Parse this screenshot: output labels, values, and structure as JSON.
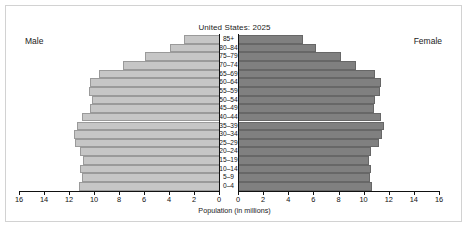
{
  "chart_data": {
    "type": "bar",
    "subtype": "population-pyramid",
    "title": "United States: 2025",
    "xlabel": "Population (in millions)",
    "ylabel": "",
    "grid": false,
    "legend_position": "inline-sides",
    "left_side_label": "Male",
    "right_side_label": "Female",
    "xlim_left": [
      16,
      0
    ],
    "xlim_right": [
      0,
      16
    ],
    "xticks_left": [
      "16",
      "14",
      "12",
      "10",
      "8",
      "6",
      "4",
      "2",
      "0"
    ],
    "xticks_right": [
      "0",
      "2",
      "4",
      "6",
      "8",
      "10",
      "12",
      "14",
      "16"
    ],
    "xtick_values": [
      16,
      14,
      12,
      10,
      8,
      6,
      4,
      2,
      0
    ],
    "categories": [
      "85+",
      "80–84",
      "75–79",
      "70–74",
      "65–69",
      "60–64",
      "55–59",
      "50–54",
      "45–49",
      "40–44",
      "35–39",
      "30–34",
      "25–29",
      "20–24",
      "15–19",
      "10–14",
      "5–9",
      "0–4"
    ],
    "series": [
      {
        "name": "Male",
        "side": "left",
        "color": "#c6c6c6",
        "values": [
          2.8,
          3.9,
          5.9,
          7.7,
          9.6,
          10.3,
          10.4,
          10.2,
          10.3,
          11.0,
          11.4,
          11.6,
          11.5,
          11.1,
          10.9,
          11.1,
          11.0,
          11.2
        ]
      },
      {
        "name": "Female",
        "side": "right",
        "color": "#808080",
        "values": [
          5.2,
          6.2,
          8.2,
          9.4,
          10.9,
          11.4,
          11.3,
          10.9,
          10.8,
          11.4,
          11.6,
          11.5,
          11.2,
          10.6,
          10.4,
          10.6,
          10.5,
          10.7
        ]
      }
    ]
  }
}
